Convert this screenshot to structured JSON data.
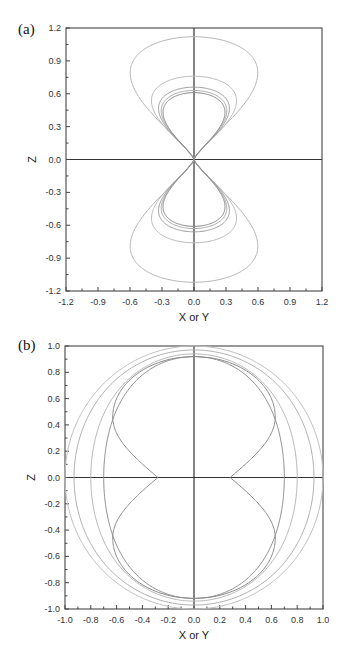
{
  "figure": {
    "panels": [
      {
        "label": "(a)",
        "xlabel": "X or Y",
        "ylabel": "Z",
        "xticks": [
          "-1.2",
          "-0.9",
          "-0.6",
          "-0.3",
          "0.0",
          "0.3",
          "0.6",
          "0.9",
          "1.2"
        ],
        "yticks": [
          "1.2",
          "0.9",
          "0.6",
          "0.3",
          "0.0",
          "-0.3",
          "-0.6",
          "-0.9",
          "-1.2"
        ]
      },
      {
        "label": "(b)",
        "xlabel": "X or Y",
        "ylabel": "Z",
        "xticks": [
          "-1.0",
          "-0.8",
          "-0.6",
          "-0.4",
          "-0.2",
          "0.0",
          "0.2",
          "0.4",
          "0.6",
          "0.8",
          "1.0"
        ],
        "yticks": [
          "1.0",
          "0.8",
          "0.6",
          "0.4",
          "0.2",
          "0.0",
          "-0.2",
          "-0.4",
          "-0.6",
          "-0.8",
          "-1.0"
        ]
      }
    ]
  },
  "chart_data": [
    {
      "type": "line",
      "title": "(a)",
      "xlabel": "X or Y",
      "ylabel": "Z",
      "xlim": [
        -1.2,
        1.2
      ],
      "ylim": [
        -1.2,
        1.2
      ],
      "grid": false,
      "legend": "none",
      "description": "Five closed teardrop-shaped lobes, symmetric about both axes, all passing through the origin (figure-eight / dumbbell shapes). Values are the approximate maximum half-width in X and maximum Z-extent of each lobe.",
      "series": [
        {
          "name": "curve 1",
          "max_halfwidth": 0.72,
          "z_at_max_width": 0.6,
          "z_extent": 1.12,
          "color": "#b5b5b5"
        },
        {
          "name": "curve 2",
          "max_halfwidth": 0.48,
          "z_at_max_width": 0.5,
          "z_extent": 0.76,
          "color": "#b8b8b8"
        },
        {
          "name": "curve 3",
          "max_halfwidth": 0.4,
          "z_at_max_width": 0.45,
          "z_extent": 0.66,
          "color": "#9a9a9a"
        },
        {
          "name": "curve 4",
          "max_halfwidth": 0.37,
          "z_at_max_width": 0.43,
          "z_extent": 0.63,
          "color": "#a8a8a8"
        },
        {
          "name": "curve 5",
          "max_halfwidth": 0.35,
          "z_at_max_width": 0.42,
          "z_extent": 0.61,
          "color": "#888888"
        }
      ]
    },
    {
      "type": "line",
      "title": "(b)",
      "xlabel": "X or Y",
      "ylabel": "Z",
      "xlim": [
        -1.0,
        1.0
      ],
      "ylim": [
        -1.0,
        1.0
      ],
      "grid": false,
      "legend": "none",
      "description": "Five closed curves symmetric about both axes: an outer near-unit circle, progressively flattened curves, and an innermost peanut-shaped curve pinched at z=0.",
      "series": [
        {
          "name": "curve 1",
          "x_at_z0": 1.0,
          "z_extent": 1.0,
          "color": "#c0c0c0"
        },
        {
          "name": "curve 2",
          "x_at_z0": 0.93,
          "z_extent": 0.97,
          "color": "#b0b0b0"
        },
        {
          "name": "curve 3",
          "x_at_z0": 0.8,
          "z_extent": 0.94,
          "color": "#b8b8b8"
        },
        {
          "name": "curve 4",
          "x_at_z0": 0.7,
          "z_extent": 0.92,
          "color": "#909090"
        },
        {
          "name": "curve 5",
          "x_at_z0": 0.28,
          "max_halfwidth": 0.63,
          "z_extent": 0.92,
          "color": "#8a8a8a"
        }
      ]
    }
  ]
}
